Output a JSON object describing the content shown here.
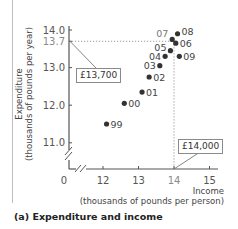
{
  "chart_data": {
    "type": "scatter",
    "title": "(a) Expenditure and income",
    "xlabel": "Income (thousands of pounds per person)",
    "ylabel": "Expenditure (thousands of pounds per year)",
    "xlim": [
      11.5,
      15.2
    ],
    "ylim": [
      10.5,
      14.1
    ],
    "axis_breaks": true,
    "x_ticks": [
      "0",
      "12",
      "13",
      "14",
      "15"
    ],
    "y_ticks": [
      "11.0",
      "12.0",
      "13.0",
      "13.7",
      "14.0"
    ],
    "grid": false,
    "reference_lines": [
      {
        "orientation": "horizontal",
        "value": 13.7,
        "style": "dotted"
      },
      {
        "orientation": "vertical",
        "value": 14.0,
        "style": "dotted"
      }
    ],
    "annotations": [
      {
        "text": "£13,700",
        "points_to": {
          "axis": "y",
          "value": 13.7
        }
      },
      {
        "text": "£14,000",
        "points_to": {
          "axis": "x",
          "value": 14.0
        }
      }
    ],
    "series": [
      {
        "name": "UK 1999-2009",
        "points": [
          {
            "label": "99",
            "x": 12.1,
            "y": 11.5
          },
          {
            "label": "00",
            "x": 12.6,
            "y": 12.05
          },
          {
            "label": "01",
            "x": 13.1,
            "y": 12.35
          },
          {
            "label": "02",
            "x": 13.3,
            "y": 12.75
          },
          {
            "label": "03",
            "x": 13.6,
            "y": 13.05
          },
          {
            "label": "04",
            "x": 13.75,
            "y": 13.3
          },
          {
            "label": "05",
            "x": 13.9,
            "y": 13.45
          },
          {
            "label": "06",
            "x": 14.05,
            "y": 13.65
          },
          {
            "label": "07",
            "x": 13.95,
            "y": 13.75
          },
          {
            "label": "08",
            "x": 14.1,
            "y": 13.9
          },
          {
            "label": "09",
            "x": 14.15,
            "y": 13.3
          }
        ]
      }
    ]
  },
  "labels": {
    "y_axis_line1": "Expenditure",
    "y_axis_line2": "(thousands of pounds per year)",
    "x_axis_line1": "Income",
    "x_axis_line2": "(thousands of pounds per person)",
    "caption": "(a) Expenditure and income",
    "callout_y": "£13,700",
    "callout_x": "£14,000"
  },
  "colors": {
    "point": "#333333",
    "axis": "#555555",
    "dotted": "#9a9a9a",
    "tick_text": "#555555",
    "highlight_tick_text": "#8a8a8a"
  }
}
